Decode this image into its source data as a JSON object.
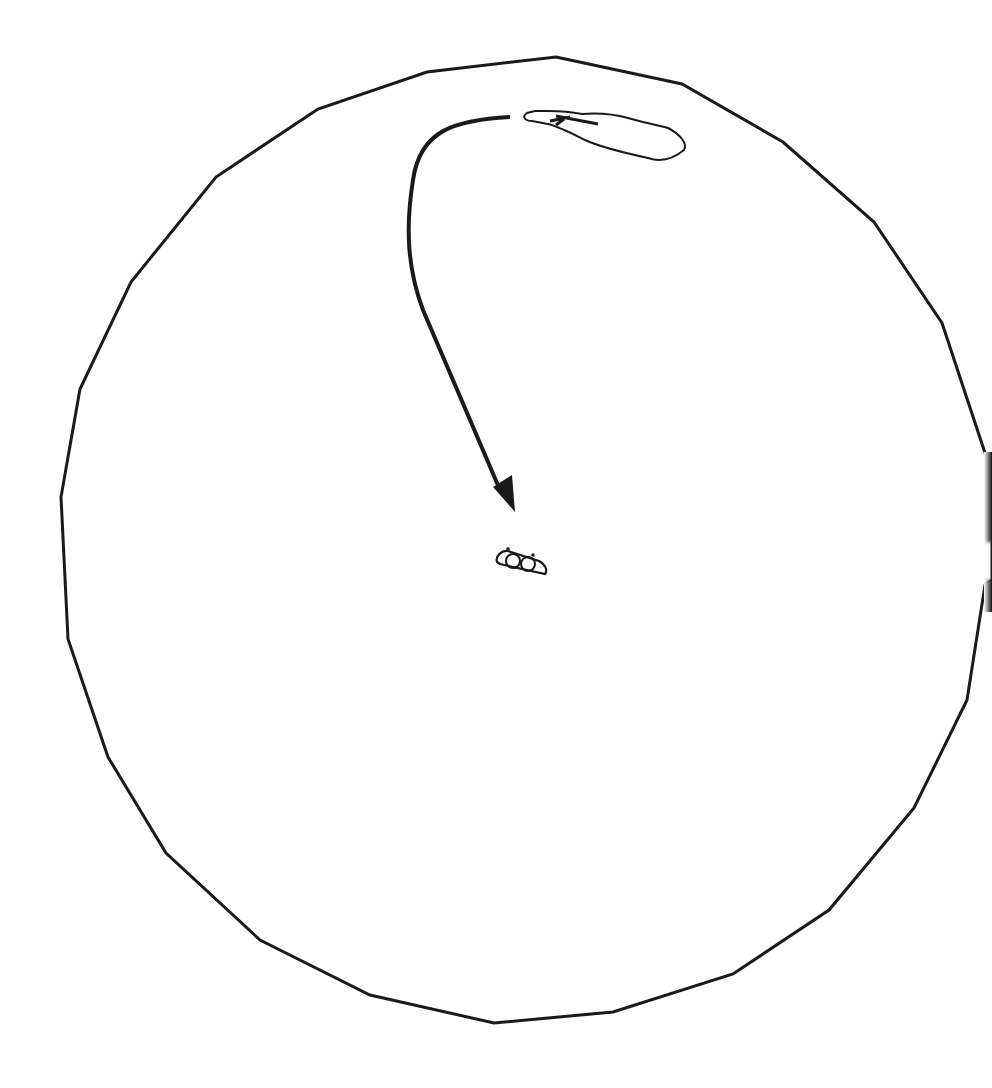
{
  "diagram": {
    "stroke_color": "#1a1a1a",
    "background": "#ffffff",
    "boundary": {
      "shape": "polygon-circle",
      "points": [
        [
          556,
          57
        ],
        [
          682,
          84
        ],
        [
          783,
          142
        ],
        [
          874,
          222
        ],
        [
          942,
          323
        ],
        [
          984,
          450
        ],
        [
          992,
          470
        ],
        [
          992,
          580
        ],
        [
          985,
          585
        ],
        [
          967,
          700
        ],
        [
          914,
          808
        ],
        [
          829,
          910
        ],
        [
          733,
          974
        ],
        [
          613,
          1012
        ],
        [
          494,
          1023
        ],
        [
          370,
          995
        ],
        [
          260,
          940
        ],
        [
          166,
          853
        ],
        [
          108,
          757
        ],
        [
          68,
          639
        ],
        [
          61,
          497
        ],
        [
          80,
          389
        ],
        [
          131,
          282
        ],
        [
          216,
          177
        ],
        [
          318,
          109
        ],
        [
          427,
          72
        ]
      ]
    },
    "arrow": {
      "path": "M 510 117 C 455 120, 420 130, 413 180 C 405 230, 408 270, 423 310 L 500 490",
      "head": [
        [
          493,
          487
        ],
        [
          515,
          512
        ],
        [
          512,
          475
        ]
      ]
    },
    "island": {
      "path": "M 527 113 C 522 116, 524 121, 532 121 L 548 124 C 560 127, 575 135, 585 140 C 600 147, 625 153, 648 158 C 660 162, 672 160, 684 150 C 688 144, 680 134, 668 128 C 655 124, 640 122, 628 118 C 610 113, 595 113, 582 114 C 572 112, 560 111, 548 111 L 535 111 Z",
      "marks": "M 556 116 L 598 124 M 550 121 L 570 117 M 556 125 L 564 119"
    },
    "center_object": {
      "outline": "M 497 562 C 495 556, 502 550, 508 551 L 539 561 C 545 564, 548 570, 545 574 L 500 564 Z",
      "circles": [
        [
          513,
          561,
          7
        ],
        [
          528,
          564,
          7
        ]
      ],
      "knobs": [
        [
          508,
          549
        ],
        [
          533,
          555
        ]
      ]
    }
  }
}
